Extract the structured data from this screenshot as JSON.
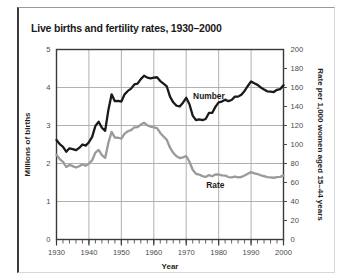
{
  "chart_data": {
    "type": "line",
    "title": "Live births and fertility rates, 1930–2000",
    "xlabel": "Year",
    "ylabel": "Millions of births",
    "y2label": "Rate per 1,000 women aged 15–44 years",
    "xlim": [
      1930,
      2000
    ],
    "ylim": [
      0,
      5
    ],
    "y2lim": [
      0,
      200
    ],
    "xticks": [
      1930,
      1940,
      1950,
      1960,
      1970,
      1980,
      1990,
      2000
    ],
    "xtick_labels": [
      "1930",
      "1940",
      "1950",
      "1960",
      "1970",
      "1980",
      "1990",
      "2000"
    ],
    "xminor_step": 2,
    "yticks": [
      0,
      1,
      2,
      3,
      4,
      5
    ],
    "ytick_labels": [
      "0",
      "1",
      "2",
      "3",
      "4",
      "5"
    ],
    "y2ticks": [
      0,
      20,
      40,
      60,
      80,
      100,
      120,
      140,
      160,
      180,
      200
    ],
    "y2tick_labels": [
      "0",
      "20",
      "40",
      "60",
      "80",
      "100",
      "120",
      "140",
      "160",
      "180",
      "200"
    ],
    "grid": "horizontal-and-decade-vertical",
    "legend_position": "inline-annotations",
    "colors": {
      "number_line": "#1a1a1a",
      "rate_line": "#9a9a9a",
      "grid": "#a8a8a8",
      "axis": "#3a3a3a",
      "tick_text": "#4a4a4a",
      "title_text": "#1a1a1a",
      "frame": "#3a3a3a",
      "background": "#ffffff"
    },
    "x": [
      1930,
      1931,
      1932,
      1933,
      1934,
      1935,
      1936,
      1937,
      1938,
      1939,
      1940,
      1941,
      1942,
      1943,
      1944,
      1945,
      1946,
      1947,
      1948,
      1949,
      1950,
      1951,
      1952,
      1953,
      1954,
      1955,
      1956,
      1957,
      1958,
      1959,
      1960,
      1961,
      1962,
      1963,
      1964,
      1965,
      1966,
      1967,
      1968,
      1969,
      1970,
      1971,
      1972,
      1973,
      1974,
      1975,
      1976,
      1977,
      1978,
      1979,
      1980,
      1981,
      1982,
      1983,
      1984,
      1985,
      1986,
      1987,
      1988,
      1989,
      1990,
      1991,
      1992,
      1993,
      1994,
      1995,
      1996,
      1997,
      1998,
      1999,
      2000
    ],
    "series": [
      {
        "name": "Number",
        "axis": "left",
        "units": "millions of births",
        "color": "#1a1a1a",
        "label_x": 1977,
        "label_y": 3.78,
        "values": [
          2.62,
          2.51,
          2.44,
          2.31,
          2.4,
          2.38,
          2.35,
          2.41,
          2.5,
          2.47,
          2.56,
          2.7,
          2.99,
          3.1,
          2.94,
          2.86,
          3.41,
          3.82,
          3.64,
          3.65,
          3.63,
          3.82,
          3.91,
          3.97,
          4.08,
          4.1,
          4.22,
          4.31,
          4.26,
          4.24,
          4.26,
          4.27,
          4.17,
          4.1,
          4.03,
          3.76,
          3.61,
          3.52,
          3.5,
          3.6,
          3.73,
          3.56,
          3.26,
          3.14,
          3.16,
          3.14,
          3.17,
          3.33,
          3.33,
          3.49,
          3.61,
          3.63,
          3.68,
          3.64,
          3.67,
          3.76,
          3.76,
          3.81,
          3.91,
          4.04,
          4.16,
          4.11,
          4.07,
          4.0,
          3.95,
          3.9,
          3.89,
          3.88,
          3.94,
          3.96,
          4.06
        ]
      },
      {
        "name": "Rate",
        "axis": "right",
        "units": "births per 1,000 women aged 15–44",
        "color": "#9a9a9a",
        "label_x": 1979,
        "label_y": 57,
        "values": [
          89.2,
          84.6,
          81.7,
          76.3,
          78.5,
          77.2,
          75.8,
          77.1,
          79.1,
          77.6,
          79.9,
          83.4,
          91.5,
          94.3,
          88.8,
          85.9,
          101.9,
          113.3,
          107.3,
          107.1,
          106.2,
          111.5,
          113.9,
          115.2,
          118.1,
          118.3,
          121.0,
          122.9,
          120.2,
          118.8,
          118.0,
          117.2,
          112.2,
          108.5,
          105.0,
          96.6,
          91.3,
          87.6,
          85.7,
          86.5,
          87.9,
          81.8,
          73.4,
          69.2,
          68.4,
          66.7,
          65.8,
          67.8,
          66.6,
          68.5,
          68.4,
          67.4,
          67.3,
          65.7,
          65.5,
          66.3,
          65.4,
          65.8,
          67.3,
          69.2,
          70.9,
          69.6,
          68.9,
          67.6,
          66.7,
          65.6,
          65.3,
          65.0,
          65.6,
          65.9,
          67.5
        ]
      }
    ]
  }
}
